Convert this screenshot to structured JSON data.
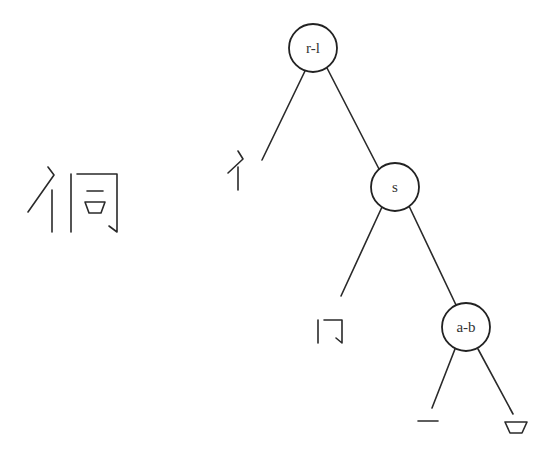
{
  "diagram": {
    "type": "character-decomposition-tree",
    "character": "侗",
    "nodes": [
      {
        "id": "root",
        "label": "r-l",
        "cx": 313,
        "cy": 48,
        "r": 24
      },
      {
        "id": "right",
        "label": "s",
        "cx": 395,
        "cy": 187,
        "r": 24
      },
      {
        "id": "inner",
        "label": "a-b",
        "cx": 466,
        "cy": 327,
        "r": 24
      }
    ],
    "leaves": [
      {
        "id": "leaf-person-radical",
        "component": "亻"
      },
      {
        "id": "leaf-enclosure",
        "component": "冂"
      },
      {
        "id": "leaf-horizontal",
        "component": "一"
      },
      {
        "id": "leaf-mouth",
        "component": "口"
      }
    ],
    "colors": {
      "stroke": "#2a2a2a",
      "background": "#ffffff"
    }
  }
}
